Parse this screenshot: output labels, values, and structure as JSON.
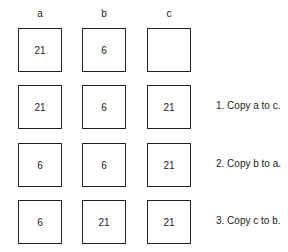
{
  "columns": [
    {
      "label": "a",
      "x": 18
    },
    {
      "label": "b",
      "x": 82
    },
    {
      "label": "c",
      "x": 147
    }
  ],
  "rows": [
    {
      "y": 28,
      "values": [
        "21",
        "6",
        ""
      ],
      "step": ""
    },
    {
      "y": 85,
      "values": [
        "21",
        "6",
        "21"
      ],
      "step": "1. Copy a to c."
    },
    {
      "y": 143,
      "values": [
        "6",
        "6",
        "21"
      ],
      "step": "2. Copy b to a."
    },
    {
      "y": 200,
      "values": [
        "6",
        "21",
        "21"
      ],
      "step": "3. Copy c to b."
    }
  ]
}
